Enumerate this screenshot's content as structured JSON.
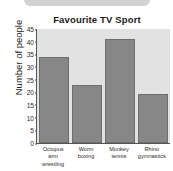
{
  "chart_data": {
    "type": "bar",
    "title": "Favourite TV Sport",
    "xlabel": "",
    "ylabel": "Number of people",
    "categories": [
      "Octopus arm wrestling",
      "Worm boxing",
      "Monkey tennis",
      "Rhino gymnastics"
    ],
    "category_lines": [
      [
        "Octopus",
        "arm wrestling"
      ],
      [
        "Worm",
        "boxing"
      ],
      [
        "Monkey",
        "tennis"
      ],
      [
        "Rhino",
        "gymnastics"
      ]
    ],
    "values": [
      34,
      23,
      41,
      19.5
    ],
    "ylim": [
      0,
      45
    ],
    "ytick_step": 5,
    "yticks": [
      "45",
      "40",
      "35",
      "30",
      "25",
      "20",
      "15",
      "10",
      "5",
      "0"
    ],
    "grid": false,
    "legend": "none",
    "colors": {
      "bar_fill": "#878787",
      "bar_edge": "#6d6d6d",
      "plot_background": "#e2e2e2",
      "axis": "#555555",
      "text": "#1a1a1a",
      "top_stub": "#d2d2d2"
    }
  }
}
